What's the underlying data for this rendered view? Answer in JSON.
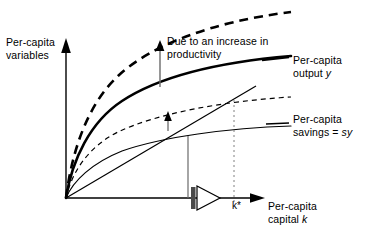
{
  "figure": {
    "title": "",
    "axes": {
      "y_title_line1": "Per-capita",
      "y_title_line2": "variables",
      "x_title_line1": "Per-capita",
      "x_title_line2": "capital k",
      "x_title_italic_symbol": "k",
      "y_title": "Per-capita variables",
      "x_title": "Per-capita capital k"
    },
    "annotations": {
      "productivity_note_line1": "Due to an increase in",
      "productivity_note_line2": "productivity",
      "productivity_note": "Due to an increase in productivity",
      "output_label_line1": "Per-capita",
      "output_label_line2": "output y",
      "output_label": "Per-capita output y",
      "savings_label_line1": "Per-capita",
      "savings_label_line2": "savings = sy",
      "savings_label": "Per-capita savings = sy",
      "steady_state_label": "k*"
    },
    "colors": {
      "ink": "#000000",
      "background": "#ffffff",
      "guide": "#555555"
    }
  },
  "chart_data": {
    "type": "line",
    "title": "",
    "xlabel": "Per-capita capital k",
    "ylabel": "Per-capita variables",
    "grid": false,
    "legend": "inline-right",
    "xlim": [
      0,
      1
    ],
    "ylim": [
      0,
      1
    ],
    "origin_px": [
      66,
      198
    ],
    "series": [
      {
        "name": "Per-capita output y (new, higher productivity)",
        "style": "dashed",
        "weight": "thick",
        "shape": "concave-increasing",
        "x": [
          0.0,
          0.05,
          0.12,
          0.22,
          0.35,
          0.5,
          0.68,
          0.85,
          1.0
        ],
        "y": [
          0.0,
          0.3,
          0.48,
          0.64,
          0.77,
          0.86,
          0.92,
          0.96,
          1.0
        ]
      },
      {
        "name": "Per-capita output y",
        "style": "solid",
        "weight": "thick",
        "shape": "concave-increasing",
        "x": [
          0.0,
          0.05,
          0.12,
          0.22,
          0.35,
          0.5,
          0.68,
          0.85,
          1.0
        ],
        "y": [
          0.0,
          0.23,
          0.37,
          0.5,
          0.6,
          0.68,
          0.74,
          0.78,
          0.82
        ]
      },
      {
        "name": "Per-capita savings = sy (new, higher productivity)",
        "style": "dashed",
        "weight": "thin",
        "shape": "concave-increasing",
        "x": [
          0.0,
          0.05,
          0.12,
          0.22,
          0.35,
          0.5,
          0.68,
          0.85,
          1.0
        ],
        "y": [
          0.0,
          0.14,
          0.24,
          0.33,
          0.41,
          0.47,
          0.51,
          0.54,
          0.56
        ]
      },
      {
        "name": "Per-capita savings = sy",
        "style": "solid",
        "weight": "thin",
        "shape": "concave-increasing",
        "x": [
          0.0,
          0.05,
          0.12,
          0.22,
          0.35,
          0.5,
          0.68,
          0.85,
          1.0
        ],
        "y": [
          0.0,
          0.1,
          0.17,
          0.24,
          0.3,
          0.35,
          0.38,
          0.4,
          0.42
        ]
      },
      {
        "name": "Break-even investment line",
        "style": "solid",
        "weight": "thin",
        "shape": "straight-through-origin",
        "x": [
          0.0,
          1.0
        ],
        "y": [
          0.0,
          0.62
        ]
      }
    ],
    "annotations": [
      {
        "name": "productivity-shift-arrow",
        "direction": "up",
        "x_px": 160,
        "y_from_px": 86,
        "y_to_px": 42,
        "label": "Due to an increase in productivity"
      },
      {
        "name": "savings-shift-arrow",
        "direction": "up",
        "x_px": 168,
        "y_from_px": 131,
        "y_to_px": 112,
        "label": ""
      },
      {
        "name": "old-equilibrium-dropline",
        "style": "solid",
        "x_px": 188
      },
      {
        "name": "new-equilibrium-dropline",
        "style": "dotted",
        "x_px": 234,
        "label": "k*"
      },
      {
        "name": "transition-marker",
        "shape": "right-triangle-with-bar",
        "x_px": 200,
        "y_px": 198
      }
    ]
  }
}
